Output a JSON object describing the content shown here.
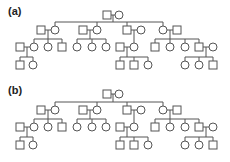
{
  "panels": [
    {
      "label": "(a)",
      "offset_y": 0,
      "individuals": [
        {
          "id": "g1m",
          "sex": "male",
          "x": 107,
          "y": 15
        },
        {
          "id": "g1f",
          "sex": "female",
          "x": 119,
          "y": 15
        },
        {
          "id": "g2a_m",
          "sex": "male",
          "x": 41,
          "y": 30
        },
        {
          "id": "g2a_f",
          "sex": "female",
          "x": 55,
          "y": 30
        },
        {
          "id": "g2b_m",
          "sex": "male",
          "x": 83,
          "y": 30
        },
        {
          "id": "g2b_f",
          "sex": "female",
          "x": 97,
          "y": 30
        },
        {
          "id": "g2c_m",
          "sex": "male",
          "x": 127,
          "y": 30
        },
        {
          "id": "g2c_f",
          "sex": "female",
          "x": 141,
          "y": 30
        },
        {
          "id": "g2d_f",
          "sex": "female",
          "x": 163,
          "y": 30
        },
        {
          "id": "g2d_m",
          "sex": "male",
          "x": 177,
          "y": 30
        },
        {
          "id": "g3a1_m",
          "sex": "male",
          "x": 20,
          "y": 47
        },
        {
          "id": "g3a1_f",
          "sex": "female",
          "x": 34,
          "y": 47
        },
        {
          "id": "g3a2",
          "sex": "female",
          "x": 48,
          "y": 47
        },
        {
          "id": "g3a3",
          "sex": "male",
          "x": 62,
          "y": 47
        },
        {
          "id": "g3b1",
          "sex": "female",
          "x": 77,
          "y": 47
        },
        {
          "id": "g3b2",
          "sex": "female",
          "x": 92,
          "y": 47
        },
        {
          "id": "g3b3",
          "sex": "female",
          "x": 106,
          "y": 47
        },
        {
          "id": "g3c1_m",
          "sex": "male",
          "x": 120,
          "y": 47
        },
        {
          "id": "g3c1_f",
          "sex": "female",
          "x": 134,
          "y": 47
        },
        {
          "id": "g3d1",
          "sex": "male",
          "x": 155,
          "y": 47
        },
        {
          "id": "g3d2",
          "sex": "female",
          "x": 170,
          "y": 47
        },
        {
          "id": "g3d3",
          "sex": "female",
          "x": 185,
          "y": 47
        },
        {
          "id": "g3d4_m",
          "sex": "male",
          "x": 199,
          "y": 47
        },
        {
          "id": "g3d4_f",
          "sex": "female",
          "x": 213,
          "y": 47
        },
        {
          "id": "g4a1",
          "sex": "male",
          "x": 20,
          "y": 65
        },
        {
          "id": "g4a2",
          "sex": "female",
          "x": 33,
          "y": 65
        },
        {
          "id": "g4c1",
          "sex": "male",
          "x": 120,
          "y": 65
        },
        {
          "id": "g4c2",
          "sex": "male",
          "x": 134,
          "y": 65
        },
        {
          "id": "g4c3",
          "sex": "female",
          "x": 148,
          "y": 65
        },
        {
          "id": "g4d1",
          "sex": "female",
          "x": 185,
          "y": 65
        },
        {
          "id": "g4d2",
          "sex": "female",
          "x": 199,
          "y": 65
        },
        {
          "id": "g4d3",
          "sex": "male",
          "x": 213,
          "y": 65
        }
      ],
      "families": [
        {
          "parents": [
            "g1m",
            "g1f"
          ],
          "sibline_y": 22,
          "children": [
            "g2a_f",
            "g2b_f",
            "g2c_m",
            "g2d_f"
          ]
        },
        {
          "parents": [
            "g2a_m",
            "g2a_f"
          ],
          "sibline_y": 39,
          "children": [
            "g3a1_f",
            "g3a2",
            "g3a3"
          ]
        },
        {
          "parents": [
            "g2b_m",
            "g2b_f"
          ],
          "sibline_y": 39,
          "children": [
            "g3b1",
            "g3b2",
            "g3b3"
          ]
        },
        {
          "parents": [
            "g2c_m",
            "g2c_f"
          ],
          "sibline_y": 39,
          "children": [
            "g3c1_f"
          ]
        },
        {
          "parents": [
            "g2d_f",
            "g2d_m"
          ],
          "sibline_y": 39,
          "children": [
            "g3d1",
            "g3d2",
            "g3d3",
            "g3d4_m"
          ]
        },
        {
          "parents": [
            "g3a1_m",
            "g3a1_f"
          ],
          "sibline_y": 57,
          "children": [
            "g4a1",
            "g4a2"
          ]
        },
        {
          "parents": [
            "g3c1_m",
            "g3c1_f"
          ],
          "sibline_y": 57,
          "children": [
            "g4c1",
            "g4c2",
            "g4c3"
          ]
        },
        {
          "parents": [
            "g3d4_m",
            "g3d4_f"
          ],
          "sibline_y": 57,
          "children": [
            "g4d1",
            "g4d2",
            "g4d3"
          ]
        }
      ]
    },
    {
      "label": "(b)",
      "offset_y": 0,
      "individuals": [
        {
          "id": "g1m",
          "sex": "male",
          "x": 107,
          "y": 13
        },
        {
          "id": "g1f",
          "sex": "female",
          "x": 119,
          "y": 13
        },
        {
          "id": "g2a_m",
          "sex": "male",
          "x": 41,
          "y": 29
        },
        {
          "id": "g2a_f",
          "sex": "female",
          "x": 55,
          "y": 29
        },
        {
          "id": "g2b_m",
          "sex": "male",
          "x": 83,
          "y": 29
        },
        {
          "id": "g2b_f",
          "sex": "female",
          "x": 97,
          "y": 29
        },
        {
          "id": "g2c_m",
          "sex": "male",
          "x": 127,
          "y": 29
        },
        {
          "id": "g2c_f",
          "sex": "female",
          "x": 141,
          "y": 29
        },
        {
          "id": "g2d_f",
          "sex": "female",
          "x": 163,
          "y": 29
        },
        {
          "id": "g2d_m",
          "sex": "male",
          "x": 177,
          "y": 29
        },
        {
          "id": "g3a1_m",
          "sex": "male",
          "x": 20,
          "y": 46
        },
        {
          "id": "g3a1_f",
          "sex": "female",
          "x": 34,
          "y": 46
        },
        {
          "id": "g3a2",
          "sex": "female",
          "x": 48,
          "y": 46
        },
        {
          "id": "g3a3",
          "sex": "male",
          "x": 62,
          "y": 46
        },
        {
          "id": "g3b1",
          "sex": "female",
          "x": 77,
          "y": 46
        },
        {
          "id": "g3b2",
          "sex": "female",
          "x": 92,
          "y": 46
        },
        {
          "id": "g3b3",
          "sex": "female",
          "x": 106,
          "y": 46
        },
        {
          "id": "g3c1_m",
          "sex": "male",
          "x": 120,
          "y": 46
        },
        {
          "id": "g3c1_f",
          "sex": "female",
          "x": 134,
          "y": 46
        },
        {
          "id": "g3d1",
          "sex": "male",
          "x": 155,
          "y": 46
        },
        {
          "id": "g3d2",
          "sex": "female",
          "x": 170,
          "y": 46
        },
        {
          "id": "g3d3",
          "sex": "female",
          "x": 185,
          "y": 46
        },
        {
          "id": "g3d4_m",
          "sex": "male",
          "x": 199,
          "y": 46
        },
        {
          "id": "g3d4_f",
          "sex": "female",
          "x": 213,
          "y": 46
        },
        {
          "id": "g4a1",
          "sex": "male",
          "x": 20,
          "y": 64
        },
        {
          "id": "g4a2",
          "sex": "female",
          "x": 33,
          "y": 64
        },
        {
          "id": "g4c1",
          "sex": "male",
          "x": 120,
          "y": 64
        },
        {
          "id": "g4c2",
          "sex": "male",
          "x": 134,
          "y": 64
        },
        {
          "id": "g4c3",
          "sex": "female",
          "x": 148,
          "y": 64
        },
        {
          "id": "g4d1",
          "sex": "female",
          "x": 185,
          "y": 64
        },
        {
          "id": "g4d2",
          "sex": "female",
          "x": 199,
          "y": 64
        },
        {
          "id": "g4d3",
          "sex": "male",
          "x": 213,
          "y": 64
        }
      ],
      "families": [
        {
          "parents": [
            "g1m",
            "g1f"
          ],
          "sibline_y": 21,
          "children": [
            "g2a_f",
            "g2b_f",
            "g2c_m",
            "g2d_f"
          ]
        },
        {
          "parents": [
            "g2a_m",
            "g2a_f"
          ],
          "sibline_y": 38,
          "children": [
            "g3a1_f",
            "g3a2",
            "g3a3"
          ]
        },
        {
          "parents": [
            "g2b_m",
            "g2b_f"
          ],
          "sibline_y": 38,
          "children": [
            "g3b1",
            "g3b2",
            "g3b3"
          ]
        },
        {
          "parents": [
            "g2c_m",
            "g2c_f"
          ],
          "sibline_y": 38,
          "children": [
            "g3c1_f"
          ]
        },
        {
          "parents": [
            "g2d_f",
            "g2d_m"
          ],
          "sibline_y": 38,
          "children": [
            "g3d1",
            "g3d2",
            "g3d3",
            "g3d4_m"
          ]
        },
        {
          "parents": [
            "g3a1_m",
            "g3a1_f"
          ],
          "sibline_y": 56,
          "children": [
            "g4a1",
            "g4a2"
          ]
        },
        {
          "parents": [
            "g3c1_m",
            "g3c1_f"
          ],
          "sibline_y": 56,
          "children": [
            "g4c1",
            "g4c2",
            "g4c3"
          ]
        },
        {
          "parents": [
            "g3d4_m",
            "g3d4_f"
          ],
          "sibline_y": 56,
          "children": [
            "g4d1",
            "g4d2",
            "g4d3"
          ]
        }
      ]
    }
  ],
  "style": {
    "stroke_color": "#555555",
    "symbol_size": 8
  }
}
